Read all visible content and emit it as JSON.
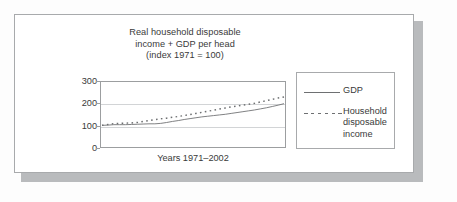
{
  "card": {
    "title_lines": [
      "Real household disposable",
      "income + GDP per head",
      "(index 1971 = 100)"
    ],
    "xaxis_caption": "Years 1971–2002",
    "border_color": "#a8aaac",
    "shadow_color": "#b9bbbd"
  },
  "legend": {
    "entries": [
      {
        "label": "GDP",
        "style": "solid",
        "color": "#6e7072"
      },
      {
        "label": "Household\ndisposable\nincome",
        "style": "dashed",
        "color": "#6e7072"
      }
    ]
  },
  "axis": {
    "yticks": [
      "300",
      "200",
      "100",
      "0"
    ],
    "ytick_values": [
      300,
      200,
      100,
      0
    ],
    "gridline_color": "#d2d4d6",
    "frame_color": "#9c9ea0"
  },
  "chart_data": {
    "type": "line",
    "title": "Real household disposable income + GDP per head (index 1971 = 100)",
    "xlabel": "Years 1971–2002",
    "ylabel": "",
    "ylim": [
      0,
      300
    ],
    "yticks": [
      0,
      100,
      200,
      300
    ],
    "grid": true,
    "legend_position": "right-outside",
    "x": [
      1971,
      1972,
      1973,
      1974,
      1975,
      1976,
      1977,
      1978,
      1979,
      1980,
      1981,
      1982,
      1983,
      1984,
      1985,
      1986,
      1987,
      1988,
      1989,
      1990,
      1991,
      1992,
      1993,
      1994,
      1995,
      1996,
      1997,
      1998,
      1999,
      2000,
      2001,
      2002
    ],
    "series": [
      {
        "name": "GDP",
        "style": "solid",
        "color": "#6e7072",
        "values": [
          100,
          101,
          103,
          103,
          103,
          104,
          105,
          106,
          107,
          107,
          109,
          113,
          118,
          122,
          127,
          131,
          135,
          139,
          142,
          145,
          148,
          151,
          155,
          159,
          163,
          167,
          171,
          176,
          181,
          187,
          193,
          200
        ]
      },
      {
        "name": "Household disposable income",
        "style": "dashed",
        "color": "#6e7072",
        "values": [
          100,
          104,
          108,
          109,
          110,
          111,
          113,
          118,
          122,
          126,
          130,
          133,
          137,
          141,
          145,
          150,
          155,
          160,
          165,
          170,
          175,
          180,
          185,
          189,
          193,
          197,
          202,
          208,
          214,
          220,
          226,
          231
        ]
      }
    ]
  }
}
